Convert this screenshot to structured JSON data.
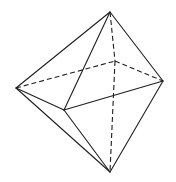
{
  "diagram": {
    "shape": "octahedron",
    "stroke_color": "#1e1e1e",
    "background": "#ffffff",
    "vertices": {
      "top": [
        110,
        12
      ],
      "bottom": [
        110,
        172
      ],
      "left": [
        16,
        88
      ],
      "right": [
        163,
        81
      ],
      "front": [
        64,
        110
      ],
      "back": [
        115,
        61
      ]
    },
    "visible_edges": [
      [
        "top",
        "left"
      ],
      [
        "top",
        "right"
      ],
      [
        "top",
        "front"
      ],
      [
        "left",
        "front"
      ],
      [
        "front",
        "right"
      ],
      [
        "left",
        "bottom"
      ],
      [
        "front",
        "bottom"
      ],
      [
        "right",
        "bottom"
      ]
    ],
    "hidden_edges": [
      [
        "left",
        "back"
      ],
      [
        "back",
        "right"
      ],
      [
        "top",
        "back"
      ],
      [
        "back",
        "bottom"
      ]
    ]
  }
}
